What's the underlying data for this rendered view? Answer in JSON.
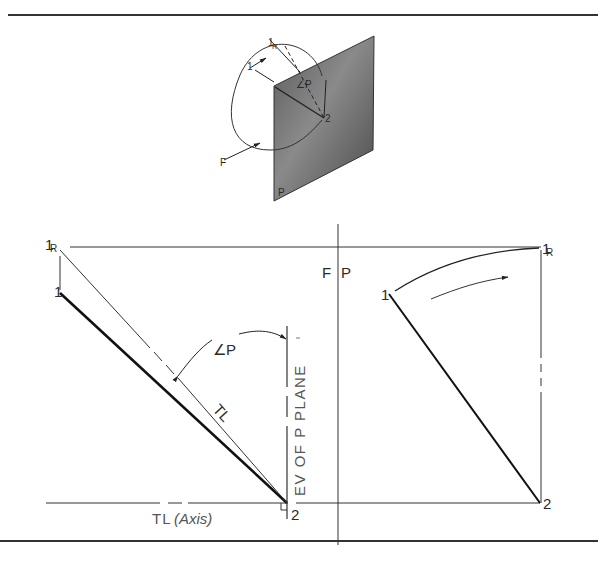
{
  "figure": {
    "type": "descriptive-geometry"
  },
  "pictorial_view": {
    "labels": {
      "point_1": "1",
      "point_1_revolved": "1",
      "point_1_revolved_sub": "R",
      "point_2": "2",
      "frontal_view_direction": "F",
      "plane": "P",
      "angle": "∠P"
    },
    "plane_color": "#6e6e6e"
  },
  "left_view": {
    "labels": {
      "point_1": "1",
      "point_1_revolved": "1",
      "point_1_revolved_sub": "R",
      "angle": "∠P",
      "true_length": "TL",
      "edge_view": "EV OF P PLANE",
      "point_2": "2",
      "axis_tl": "TL",
      "axis_note": "(Axis)"
    }
  },
  "fold_line": {
    "left_label": "F",
    "right_label": "P"
  },
  "right_view": {
    "labels": {
      "point_1": "1",
      "point_1_revolved": "1",
      "point_1_revolved_sub": "R",
      "point_2": "2"
    }
  }
}
